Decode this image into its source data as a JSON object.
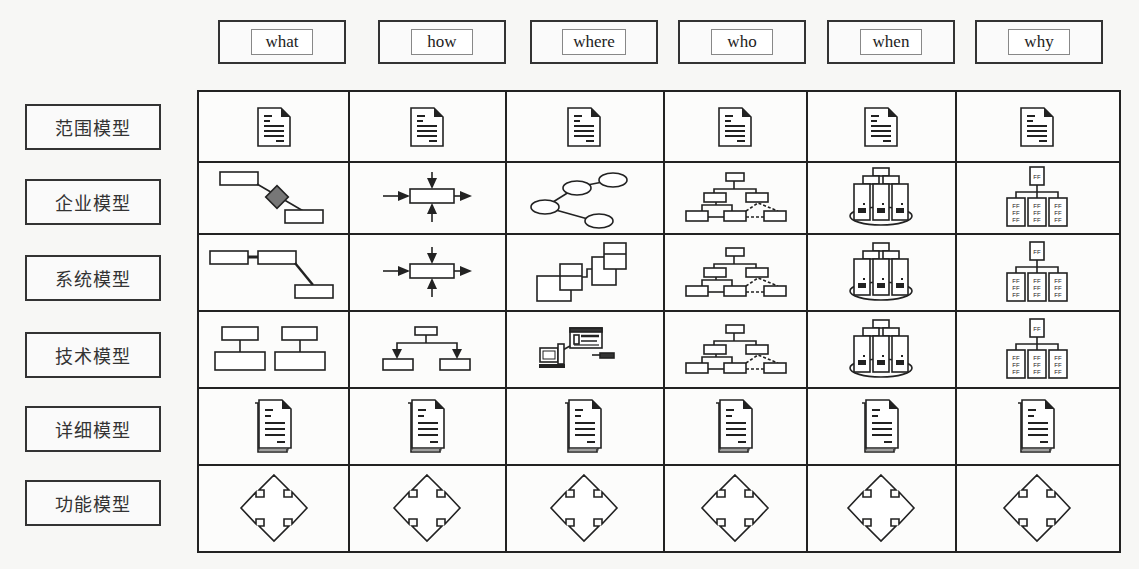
{
  "columns": [
    {
      "label": "what"
    },
    {
      "label": "how"
    },
    {
      "label": "where"
    },
    {
      "label": "who"
    },
    {
      "label": "when"
    },
    {
      "label": "why"
    }
  ],
  "rows": [
    {
      "label": "范围模型",
      "icons": [
        "document-icon",
        "document-icon",
        "document-icon",
        "document-icon",
        "document-icon",
        "document-icon"
      ]
    },
    {
      "label": "企业模型",
      "icons": [
        "entity-relationship-icon",
        "process-arrows-icon",
        "network-nodes-icon",
        "org-hierarchy-icon",
        "server-cluster-icon",
        "rule-tree-icon"
      ]
    },
    {
      "label": "系统模型",
      "icons": [
        "linked-entities-icon",
        "process-arrows-icon",
        "distributed-blocks-icon",
        "org-hierarchy-icon",
        "server-cluster-icon",
        "rule-tree-icon"
      ]
    },
    {
      "label": "技术模型",
      "icons": [
        "table-structure-icon",
        "branching-flow-icon",
        "computer-terminal-icon",
        "org-hierarchy-icon",
        "server-cluster-icon",
        "rule-tree-icon"
      ]
    },
    {
      "label": "详细模型",
      "icons": [
        "stacked-document-icon",
        "stacked-document-icon",
        "stacked-document-icon",
        "stacked-document-icon",
        "stacked-document-icon",
        "stacked-document-icon"
      ]
    },
    {
      "label": "功能模型",
      "icons": [
        "four-way-arrows-icon",
        "four-way-arrows-icon",
        "four-way-arrows-icon",
        "four-way-arrows-icon",
        "four-way-arrows-icon",
        "four-way-arrows-icon"
      ]
    }
  ]
}
